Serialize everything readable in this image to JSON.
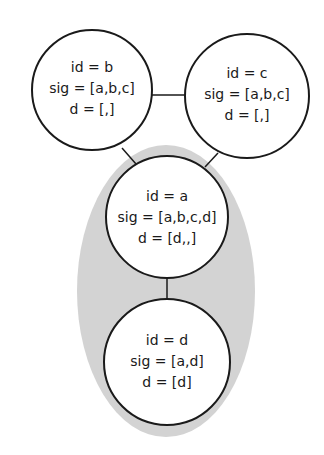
{
  "diagram": {
    "type": "graph",
    "highlight_region": {
      "label": "",
      "color": "#d3d3d3",
      "contains": [
        "a",
        "d"
      ]
    },
    "nodes": [
      {
        "key": "b",
        "cx": 92,
        "cy": 90,
        "r": 60,
        "lines": [
          "id = b",
          "sig = [a,b,c]",
          "d = [,]"
        ]
      },
      {
        "key": "c",
        "cx": 247,
        "cy": 96,
        "r": 62,
        "lines": [
          "id = c",
          "sig = [a,b,c]",
          "d = [,]"
        ]
      },
      {
        "key": "a",
        "cx": 167,
        "cy": 217,
        "r": 61,
        "lines": [
          "id = a",
          "sig = [a,b,c,d]",
          "d = [d,,]"
        ]
      },
      {
        "key": "d",
        "cx": 167,
        "cy": 362,
        "r": 63,
        "lines": [
          "id = d",
          "sig = [a,d]",
          "d = [d]"
        ]
      }
    ],
    "edges": [
      {
        "from": "b",
        "to": "c"
      },
      {
        "from": "b",
        "to": "a"
      },
      {
        "from": "c",
        "to": "a"
      },
      {
        "from": "a",
        "to": "d"
      }
    ],
    "colors": {
      "stroke": "#1a1a1a",
      "node_fill": "#ffffff",
      "region_fill": "#d3d3d3",
      "background": "#ffffff"
    }
  }
}
